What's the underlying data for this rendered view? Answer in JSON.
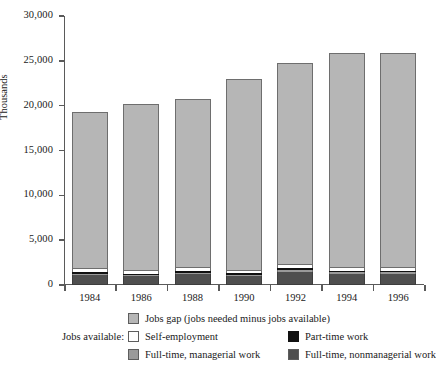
{
  "chart_data": {
    "type": "bar",
    "title": "",
    "xlabel": "",
    "ylabel": "Thousands",
    "ylim": [
      0,
      30000
    ],
    "ytick_labels": [
      "0",
      "5,000",
      "10,000",
      "15,000",
      "20,000",
      "25,000",
      "30,000"
    ],
    "ytick_values": [
      0,
      5000,
      10000,
      15000,
      20000,
      25000,
      30000
    ],
    "grid": false,
    "stacked": true,
    "legend_position": "below",
    "categories": [
      "1984",
      "1986",
      "1988",
      "1990",
      "1992",
      "1994",
      "1996"
    ],
    "series": [
      {
        "name": "Full-time, nonmanagerial work",
        "color": "#4f4f4f",
        "values": [
          1150,
          950,
          1200,
          1000,
          1500,
          1250,
          1250
        ]
      },
      {
        "name": "Full-time, managerial work",
        "color": "#9a9a9a",
        "values": [
          130,
          130,
          140,
          130,
          150,
          150,
          150
        ]
      },
      {
        "name": "Part-time work",
        "color": "#111111",
        "values": [
          200,
          170,
          200,
          180,
          220,
          210,
          210
        ]
      },
      {
        "name": "Self-employment",
        "color": "#ffffff",
        "values": [
          300,
          260,
          310,
          270,
          330,
          320,
          320
        ]
      },
      {
        "name": "Jobs gap (jobs needed minus jobs available)",
        "color": "#b6b6b6",
        "values": [
          17520,
          18690,
          18850,
          21420,
          22600,
          23970,
          23970
        ]
      }
    ],
    "totals": [
      19300,
      20200,
      20700,
      23000,
      24800,
      25900,
      25900
    ]
  },
  "legend": {
    "gap_label": "Jobs gap (jobs needed minus jobs available)",
    "jobs_available_label": "Jobs available:",
    "self_employment_label": "Self-employment",
    "part_time_label": "Part-time work",
    "managerial_label": "Full-time, managerial work",
    "nonmanagerial_label": "Full-time, nonmanagerial work"
  },
  "colors": {
    "gap": "#b6b6b6",
    "self_employment": "#ffffff",
    "part_time": "#111111",
    "managerial": "#9a9a9a",
    "nonmanagerial": "#4f4f4f",
    "axis": "#5a5a5a",
    "background": "#ffffff"
  }
}
